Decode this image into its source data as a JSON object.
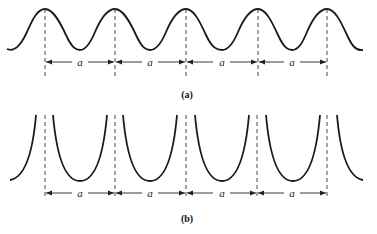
{
  "figure": {
    "panels": [
      {
        "id": "a",
        "label": "(a)",
        "description": "periodic smooth sinusoidal potential with peaks at each lattice site",
        "spacing_label": "a",
        "peak_x": [
          45,
          115,
          186,
          258,
          327
        ]
      },
      {
        "id": "b",
        "label": "(b)",
        "description": "periodic parabolic (U-shaped) wells separated by singular barriers at lattice sites",
        "spacing_label": "a",
        "boundary_x": [
          45,
          115,
          186,
          257,
          327
        ]
      }
    ],
    "spacing_labels": [
      "a",
      "a",
      "a",
      "a"
    ],
    "colors": {
      "line": "#1a1a1a",
      "background": "#ffffff"
    }
  }
}
